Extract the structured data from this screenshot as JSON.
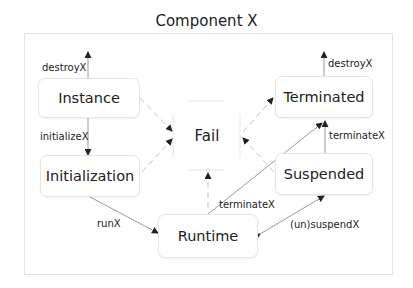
{
  "diagram": {
    "title": "Component X",
    "colors": {
      "edge": "#555555",
      "dashed_edge": "#bbbbbb",
      "node_border": "#e4e4e4",
      "text": "#222222"
    },
    "nodes": [
      {
        "id": "instance",
        "label": "Instance"
      },
      {
        "id": "initialization",
        "label": "Initialization"
      },
      {
        "id": "runtime",
        "label": "Runtime"
      },
      {
        "id": "fail",
        "label": "Fail"
      },
      {
        "id": "terminated",
        "label": "Terminated"
      },
      {
        "id": "suspended",
        "label": "Suspended"
      }
    ],
    "edges": [
      {
        "from": "instance",
        "to": "(out)",
        "label": "destroyX",
        "style": "solid"
      },
      {
        "from": "instance",
        "to": "initialization",
        "label": "initializeX",
        "style": "solid"
      },
      {
        "from": "initialization",
        "to": "runtime",
        "label": "runX",
        "style": "solid"
      },
      {
        "from": "runtime",
        "to": "terminated",
        "label": "terminateX",
        "style": "solid"
      },
      {
        "from": "suspended",
        "to": "terminated",
        "label": "terminateX",
        "style": "solid"
      },
      {
        "from": "runtime",
        "to": "suspended",
        "label": "(un)suspendX",
        "style": "solid",
        "bidirectional": true
      },
      {
        "from": "terminated",
        "to": "(out)",
        "label": "destroyX",
        "style": "solid"
      },
      {
        "from": "instance",
        "to": "fail",
        "label": "",
        "style": "dashed"
      },
      {
        "from": "initialization",
        "to": "fail",
        "label": "",
        "style": "dashed"
      },
      {
        "from": "runtime",
        "to": "fail",
        "label": "",
        "style": "dashed"
      },
      {
        "from": "suspended",
        "to": "fail",
        "label": "",
        "style": "dashed"
      },
      {
        "from": "fail",
        "to": "terminated",
        "label": "",
        "style": "dashed"
      }
    ],
    "labels": {
      "destroy_left": "destroyX",
      "initialize": "initializeX",
      "run": "runX",
      "terminate_runtime": "terminateX",
      "terminate_suspended": "terminateX",
      "suspend": "(un)suspendX",
      "destroy_right": "destroyX"
    }
  }
}
